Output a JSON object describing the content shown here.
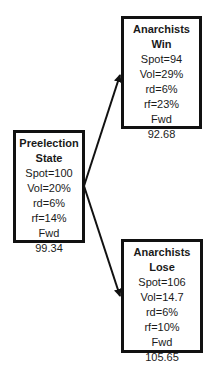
{
  "diagram": {
    "type": "binary-tree",
    "nodes": {
      "pre": {
        "title_line1": "Preelection",
        "title_line2": "State",
        "spot": "Spot=100",
        "vol": "Vol=20%",
        "rd": "rd=6%",
        "rf": "rf=14%",
        "fwd_label": "Fwd",
        "fwd_value": "99.34"
      },
      "win": {
        "title_line1": "Anarchists",
        "title_line2": "Win",
        "spot": "Spot=94",
        "vol": "Vol=29%",
        "rd": "rd=6%",
        "rf": "rf=23%",
        "fwd_label": "Fwd",
        "fwd_value": "92.68"
      },
      "lose": {
        "title_line1": "Anarchists",
        "title_line2": "Lose",
        "spot": "Spot=106",
        "vol": "Vol=14.7",
        "rd": "rd=6%",
        "rf": "rf=10%",
        "fwd_label": "Fwd",
        "fwd_value": "105.65"
      }
    },
    "edges": [
      {
        "from": "pre",
        "to": "win"
      },
      {
        "from": "pre",
        "to": "lose"
      }
    ],
    "colors": {
      "stroke": "#111111",
      "background": "#ffffff",
      "text": "#1a1a1a"
    }
  }
}
